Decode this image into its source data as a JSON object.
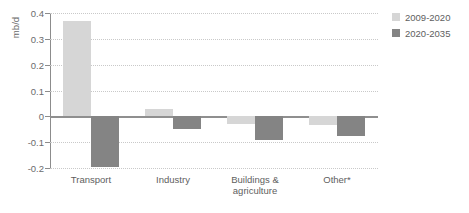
{
  "chart_data": {
    "type": "bar",
    "title": "",
    "xlabel": "",
    "ylabel": "mb/d",
    "ylim": [
      -0.2,
      0.4
    ],
    "yticks": [
      0.4,
      0.3,
      0.2,
      0.1,
      0,
      -0.1,
      -0.2
    ],
    "ytick_labels": [
      "0.4",
      "0.3",
      "0.2",
      "0.1",
      "0",
      "-0.1",
      "-0.2"
    ],
    "grid": true,
    "grid_style": "dotted-horizontal",
    "legend_position": "right-top",
    "categories": [
      "Transport",
      "Industry",
      "Buildings &\nagriculture",
      "Other*"
    ],
    "series": [
      {
        "name": "2009-2020",
        "color": "#d6d6d6",
        "values": [
          0.37,
          0.03,
          -0.03,
          -0.035
        ]
      },
      {
        "name": "2020-2035",
        "color": "#848484",
        "values": [
          -0.195,
          -0.05,
          -0.09,
          -0.075
        ]
      }
    ]
  },
  "axis": {
    "zero_line_color": "#8f8f8f",
    "axis_line_color": "#8c8c8c",
    "grid_color": "#c9c9c9"
  }
}
